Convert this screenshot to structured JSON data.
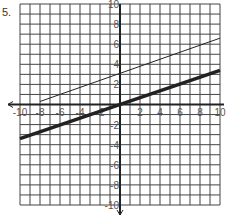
{
  "problem_number": "5.",
  "chart_data": {
    "type": "line",
    "title": "",
    "xlabel": "",
    "ylabel": "",
    "xlim": [
      -10,
      10
    ],
    "ylim": [
      -10,
      10
    ],
    "grid": true,
    "x_ticks": [
      -10,
      -8,
      -6,
      -4,
      -2,
      2,
      4,
      6,
      8,
      10
    ],
    "y_ticks": [
      10,
      8,
      6,
      4,
      2,
      -2,
      -4,
      -6,
      -8,
      -10
    ],
    "series": [
      {
        "name": "thin line",
        "style": "thin",
        "x": [
          -8,
          10
        ],
        "y": [
          0.3,
          6.6
        ]
      },
      {
        "name": "thick line",
        "style": "thick",
        "x": [
          -10,
          10
        ],
        "y": [
          -3.4,
          3.4
        ]
      }
    ]
  }
}
